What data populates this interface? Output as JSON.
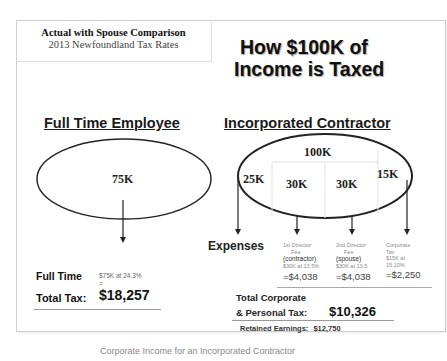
{
  "subtitle": {
    "line1": "Actual with Spouse Comparison",
    "line2": "2013 Newfoundland Tax Rates"
  },
  "title": {
    "line1": "How $100K of",
    "line2": "Income  is Taxed"
  },
  "employee": {
    "heading": "Full Time Employee",
    "income_label": "75K",
    "label": "Full Time",
    "detail_line1": "$75K at 24.3%",
    "detail_line2": "=",
    "total_label": "Total Tax:",
    "total_value": "$18,257"
  },
  "contractor": {
    "heading": "Incorporated Contractor",
    "total_income": "100K",
    "segments": [
      {
        "label": "25K"
      },
      {
        "label": "30K"
      },
      {
        "label": "30K"
      },
      {
        "label": "15K"
      }
    ],
    "expenses_label": "Expenses",
    "expense_columns": [
      {
        "line1": "1st Director",
        "line2": "Fee",
        "role": "(contractor)",
        "detail": "$30K at 13.5%",
        "amount": "=$4,038"
      },
      {
        "line1": "2nd Director",
        "line2": "Fee",
        "role": "(spouse)",
        "detail": "$30K at 13.5",
        "amount": "=$4,038"
      },
      {
        "line1": "Corporate",
        "line2": "Tax",
        "role": "$15K at",
        "detail": "15.10%",
        "amount": "=$2,250"
      }
    ],
    "total_label_line1": "Total Corporate",
    "total_label_line2": "& Personal Tax:",
    "total_value": "$10,326",
    "retained_label": "Retained Earnings:",
    "retained_value": "$12,750"
  },
  "caption": "Corporate Income for an Incorporated Contractor"
}
